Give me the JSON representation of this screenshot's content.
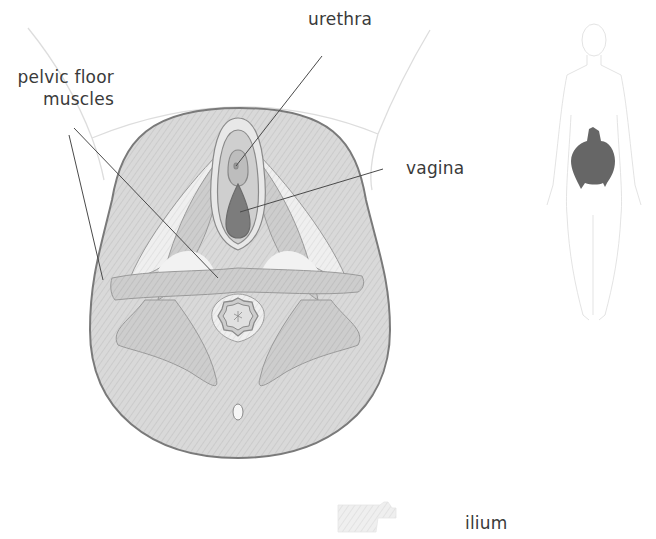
{
  "diagram": {
    "labels": {
      "urethra": "urethra",
      "pelvic_floor_line1": "pelvic floor",
      "pelvic_floor_line2": "muscles",
      "vagina": "vagina",
      "ilium": "ilium"
    },
    "colors": {
      "outline": "#7a7a7a",
      "body_fill": "#d6d6d6",
      "muscle_fill": "#c8c8c8",
      "light_fill": "#ececec",
      "vagina_fill": "#7c7c7c",
      "leader_line": "#4a4a4a",
      "text": "#3a3a3a",
      "locator_highlight": "#6a6a6a",
      "locator_outline": "#dcdcdc"
    },
    "inset": {
      "name": "body-locator",
      "highlight": "pelvis"
    },
    "legend": {
      "swatch": "bone-hatch",
      "label": "ilium"
    }
  }
}
